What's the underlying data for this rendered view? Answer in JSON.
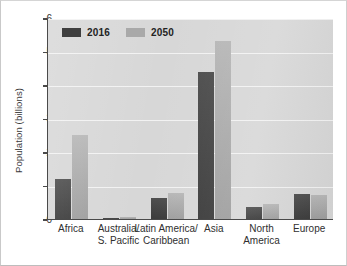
{
  "chart_data": {
    "type": "bar",
    "title": "",
    "subtitle": "",
    "xlabel": "",
    "ylabel": "Population (billions)",
    "ylim": [
      0,
      6
    ],
    "yticks": [
      0,
      1,
      2,
      3,
      4,
      5,
      6
    ],
    "ytick_labels": [
      "0",
      "1",
      "2",
      "3",
      "4",
      "5",
      "6"
    ],
    "grid": "horizontal",
    "legend_position": "top-left-inside",
    "categories": [
      "Africa",
      "Australia/ S. Pacific",
      "Latin America/ Caribbean",
      "Asia",
      "North America",
      "Europe"
    ],
    "category_lines": [
      [
        "Africa",
        ""
      ],
      [
        "Australia/",
        "S. Pacific"
      ],
      [
        "Latin America/",
        "Caribbean"
      ],
      [
        "Asia",
        ""
      ],
      [
        "North",
        "America"
      ],
      [
        "Europe",
        ""
      ]
    ],
    "series": [
      {
        "name": "2016",
        "color": "#3f3f3f",
        "values": [
          1.2,
          0.04,
          0.64,
          4.4,
          0.36,
          0.74
        ]
      },
      {
        "name": "2050",
        "color": "#a9a9a9",
        "values": [
          2.5,
          0.06,
          0.78,
          5.3,
          0.45,
          0.72
        ]
      }
    ]
  },
  "legend": {
    "items": [
      {
        "label": "2016",
        "color": "#3f3f3f"
      },
      {
        "label": "2050",
        "color": "#a9a9a9"
      }
    ]
  },
  "colors": {
    "series_2016": "#3f3f3f",
    "series_2050": "#a9a9a9",
    "plot_background": "#d7d7d7",
    "gridline": "#f2f2f2",
    "axis": "#4a4a4a",
    "page_background": "#ffffff"
  }
}
